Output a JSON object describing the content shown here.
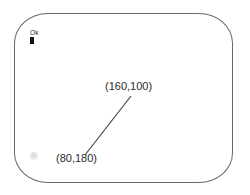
{
  "canvas": {
    "name": "rounded-screen-outline",
    "outline_color": "#6a6a6a",
    "background_color": "#ffffff"
  },
  "status": {
    "ok_label": "Ok",
    "marker_color": "#141414"
  },
  "markers": {
    "faint_marker_color": "#d8d8d8"
  },
  "annotations": {
    "connector_color": "#3a3a3a",
    "upper_point_label": "(160,100)",
    "lower_point_label": "(80,180)",
    "points": [
      {
        "label": "(160,100)",
        "x": 160,
        "y": 100
      },
      {
        "label": "(80,180)",
        "x": 80,
        "y": 180
      }
    ]
  }
}
